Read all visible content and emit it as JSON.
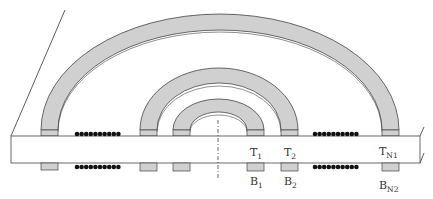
{
  "diagram": {
    "type": "coil-cross-section",
    "colors": {
      "trace_fill": "#d0d0d0",
      "outline": "#444444",
      "substrate_fill": "#ffffff",
      "dots": "#111111"
    },
    "labels": {
      "top": [
        {
          "main": "T",
          "sub": "1"
        },
        {
          "main": "T",
          "sub": "2"
        },
        {
          "main": "T",
          "sub": "N1"
        }
      ],
      "bottom": [
        {
          "main": "B",
          "sub": "1"
        },
        {
          "main": "B",
          "sub": "2"
        },
        {
          "main": "B",
          "sub": "N2"
        }
      ]
    },
    "dot_rows": {
      "count_per_row": 10,
      "rows": 4
    }
  }
}
